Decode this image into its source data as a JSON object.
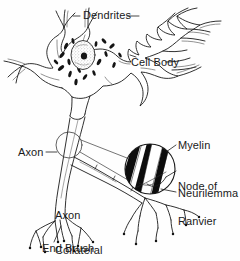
{
  "figure": {
    "background_color": "#fefefe",
    "ink_color": "#1a1a1a",
    "labels": {
      "dendrites": "Dendrites",
      "cell_body": "Cell Body",
      "axon": "Axon",
      "axon_collateral_line1": "Axon",
      "axon_collateral_line2": "Collateral",
      "end_brush": "End Brush",
      "myelin": "Myelin",
      "node_of_ranvier_line1": "Node of",
      "node_of_ranvier_line2": "Ranvier",
      "neurilemma": "Neurilemma"
    },
    "parts": [
      "dendrites",
      "cell-body",
      "nucleus",
      "nucleolus",
      "nissl-bodies",
      "axon-hillock",
      "axon",
      "axon-collateral",
      "myelin-sheath",
      "node-of-ranvier",
      "neurilemma",
      "end-brush",
      "synaptic-knobs",
      "magnification-callout-circle"
    ]
  }
}
